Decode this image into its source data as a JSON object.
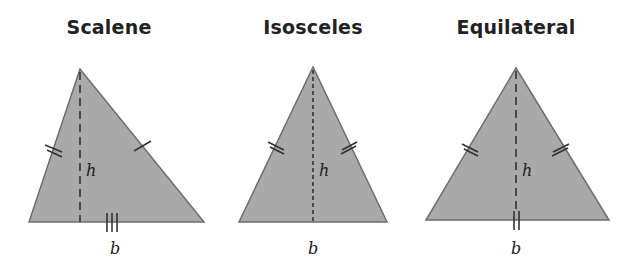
{
  "colors": {
    "fill": "#a9a9a9",
    "stroke": "#6e6e6e",
    "ink": "#222222"
  },
  "triangles": [
    {
      "title": "Scalene",
      "height_label": "h",
      "base_label": "b",
      "tick_marks": {
        "left_side": 2,
        "right_side": 1,
        "base": 3
      }
    },
    {
      "title": "Isosceles",
      "height_label": "h",
      "base_label": "b",
      "tick_marks": {
        "left_side": 2,
        "right_side": 2,
        "base": 0
      }
    },
    {
      "title": "Equilateral",
      "height_label": "h",
      "base_label": "b",
      "tick_marks": {
        "left_side": 2,
        "right_side": 2,
        "base": 2
      }
    }
  ]
}
